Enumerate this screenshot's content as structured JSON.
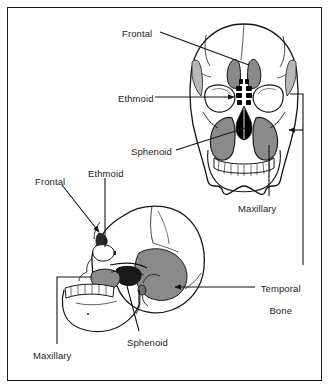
{
  "figure": {
    "type": "anatomical-diagram",
    "views": [
      {
        "name": "anterior-skull-view",
        "orientation": "anterior (frontal)"
      },
      {
        "name": "lateral-skull-view",
        "orientation": "lateral (left side profile)"
      }
    ]
  },
  "labels": {
    "anterior": {
      "frontal": {
        "text": "Frontal",
        "x": 122,
        "y": 28
      },
      "ethmoid": {
        "text": "Ethmoid",
        "x": 118,
        "y": 93
      },
      "sphenoid": {
        "text": "Sphenoid",
        "x": 131,
        "y": 146
      },
      "maxillary": {
        "text": "Maxillary",
        "x": 238,
        "y": 203
      }
    },
    "lateral": {
      "frontal": {
        "text": "Frontal",
        "x": 35,
        "y": 176
      },
      "ethmoid": {
        "text": "Ethmoid",
        "x": 88,
        "y": 168
      },
      "sphenoid": {
        "text": "Sphenoid",
        "x": 127,
        "y": 337
      },
      "maxillary": {
        "text": "Maxillary",
        "x": 33,
        "y": 350
      }
    },
    "shared": {
      "temporal_bone_line1": "Temporal",
      "temporal_bone_line2": "Bone",
      "temporal_bone_x": 259,
      "temporal_bone_y": 272
    }
  },
  "colors": {
    "outline": "#151515",
    "frame": "#1a1a1a",
    "background": "#ffffff",
    "sinus_dark": "#000000",
    "sinus_mid_gray": "#8a8a8a",
    "sinus_light_gray": "#b8b8b8",
    "bone_tint": "#f2f2f2"
  }
}
